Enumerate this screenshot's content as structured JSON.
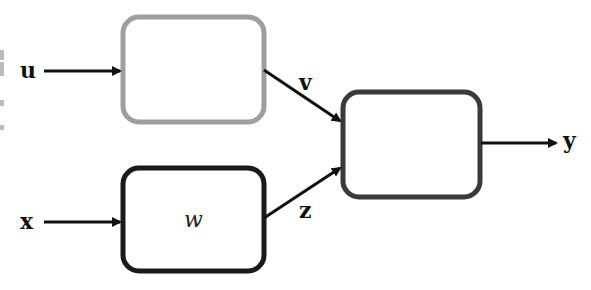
{
  "diagram": {
    "type": "block-diagram",
    "nodes": [
      {
        "id": "top-box",
        "label": "",
        "border_color": "#9e9e9e"
      },
      {
        "id": "bottom-box",
        "label": "w",
        "border_color": "#1a1a1a"
      },
      {
        "id": "output-box",
        "label": "",
        "border_color": "#3a3a3a"
      }
    ],
    "inputs": {
      "u": "u",
      "x": "x"
    },
    "edges": [
      {
        "from": "u",
        "to": "top-box",
        "label": ""
      },
      {
        "from": "x",
        "to": "bottom-box",
        "label": ""
      },
      {
        "from": "top-box",
        "to": "output-box",
        "label": "v"
      },
      {
        "from": "bottom-box",
        "to": "output-box",
        "label": "z"
      },
      {
        "from": "output-box",
        "to": "y",
        "label": ""
      }
    ],
    "output": {
      "y": "y"
    },
    "labels": {
      "u": "u",
      "x": "x",
      "v": "v",
      "z": "z",
      "y": "y",
      "w": "w"
    },
    "colors": {
      "arrow": "#111111",
      "top_box": "#9e9e9e",
      "bottom_box": "#1a1a1a",
      "output_box": "#3a3a3a"
    }
  }
}
